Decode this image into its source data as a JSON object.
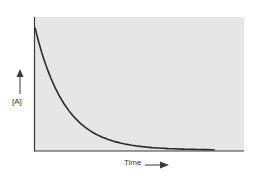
{
  "chart_data": {
    "type": "line",
    "title": "",
    "xlabel": "Time",
    "ylabel": "[A]",
    "x_arrow": "right",
    "y_arrow": "up",
    "grid": false,
    "legend": null,
    "xlim": [
      0,
      10
    ],
    "ylim": [
      0,
      1
    ],
    "series": [
      {
        "name": "[A]",
        "x": [
          0,
          0.5,
          1,
          1.5,
          2,
          2.5,
          3,
          4,
          5,
          6,
          7,
          8,
          8.6
        ],
        "values": [
          0.92,
          0.65,
          0.46,
          0.33,
          0.24,
          0.17,
          0.12,
          0.07,
          0.04,
          0.025,
          0.015,
          0.008,
          0.0
        ]
      }
    ],
    "colors": {
      "plot_background": "#e6e6e6",
      "curve": "#2a2a2a",
      "axis": "#3a3a3a"
    }
  },
  "labels": {
    "y": "[A]",
    "x": "Time"
  }
}
